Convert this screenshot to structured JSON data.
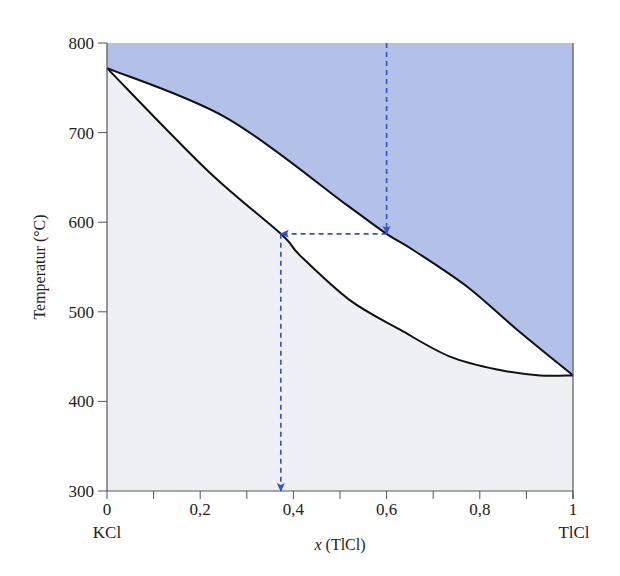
{
  "chart_data": {
    "type": "line",
    "title": "",
    "xlabel": "x (TlCl)",
    "xlabel_italic_part": "x",
    "xlabel_rest": " (TlCl)",
    "ylabel": "Temperatur (°C)",
    "xlim": [
      0,
      1
    ],
    "ylim": [
      300,
      800
    ],
    "x_ticks": [
      0,
      0.2,
      0.4,
      0.6,
      0.8,
      1
    ],
    "x_tick_labels": [
      "0",
      "0,2",
      "0,4",
      "0,6",
      "0,8",
      "1"
    ],
    "x_minor_ticks": [
      0.1,
      0.3,
      0.5,
      0.7,
      0.9
    ],
    "y_ticks": [
      300,
      400,
      500,
      600,
      700,
      800
    ],
    "y_tick_labels": [
      "300",
      "400",
      "500",
      "600",
      "700",
      "800"
    ],
    "endpoint_labels": {
      "left": "KCl",
      "right": "TlCl"
    },
    "grid": false,
    "legend": null,
    "series": [
      {
        "name": "Liquidus",
        "x": [
          0,
          0.258,
          0.515,
          0.6,
          0.657,
          0.773,
          0.88,
          1.0
        ],
        "y": [
          772,
          716,
          619,
          587,
          569,
          528,
          480,
          429
        ]
      },
      {
        "name": "Solidus",
        "x": [
          0,
          0.215,
          0.373,
          0.414,
          0.521,
          0.629,
          0.736,
          0.843,
          0.929,
          1.0
        ],
        "y": [
          772,
          658,
          587,
          563,
          513,
          480,
          450,
          435,
          429,
          429
        ]
      }
    ],
    "regions": [
      {
        "name": "liquid",
        "fill": "#b3c0e8",
        "location": "above liquidus"
      },
      {
        "name": "two-phase",
        "fill": "#ffffff",
        "location": "between curves"
      },
      {
        "name": "solid",
        "fill": "#eef0f5",
        "location": "below solidus"
      }
    ],
    "annotations": [
      {
        "type": "dashed-arrow",
        "from": [
          0.6,
          800
        ],
        "to": [
          0.6,
          587
        ],
        "color": "#3551c4"
      },
      {
        "type": "dashed-arrow",
        "from": [
          0.6,
          587
        ],
        "to": [
          0.373,
          587
        ],
        "color": "#3551c4"
      },
      {
        "type": "dashed-arrow",
        "from": [
          0.373,
          587
        ],
        "to": [
          0.373,
          300
        ],
        "color": "#3551c4"
      }
    ],
    "colors": {
      "liquid_region": "#b3c0e8",
      "solid_region": "#eef0f5",
      "curve": "#111111",
      "arrow": "#3551c4",
      "axis": "#555555"
    }
  }
}
